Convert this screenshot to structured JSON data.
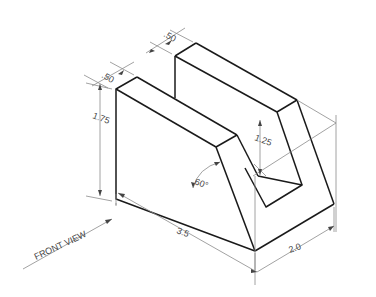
{
  "drawing": {
    "type": "isometric technical drawing",
    "labels": {
      "front_view": "FRONT VIEW",
      "dim_depth_left": ".50",
      "dim_depth_back": ".50",
      "dim_height": "1.75",
      "dim_slot_height": "1.25",
      "dim_angle": "60°",
      "dim_length": "3.5",
      "dim_width": "2.0"
    },
    "colors": {
      "object_line": "#1a1a1a",
      "dimension_line": "#8a8a8a",
      "background": "#ffffff"
    }
  }
}
